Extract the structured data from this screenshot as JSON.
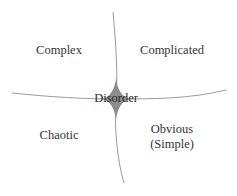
{
  "diagram": {
    "domains": {
      "top_left": "Complex",
      "top_right": "Complicated",
      "bottom_left": "Chaotic",
      "bottom_right_line1": "Obvious",
      "bottom_right_line2": "(Simple)",
      "center": "Disorder"
    },
    "colors": {
      "lines": "#999999",
      "center_shape": "#8c8c8c",
      "text": "#333333",
      "background": "#ffffff"
    }
  }
}
